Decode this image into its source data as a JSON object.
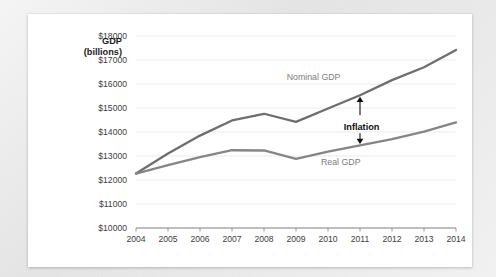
{
  "card": {
    "background_color": "#ffffff",
    "page_background_color": "#e9e9e9"
  },
  "axis_title": {
    "line1": "GDP",
    "line2": "(billions)"
  },
  "chart_data": {
    "type": "line",
    "title": "",
    "subtitle": "",
    "xlabel": "",
    "ylabel": "GDP (billions)",
    "grid": true,
    "legend_position": "inline-annotation",
    "x": [
      2004,
      2005,
      2006,
      2007,
      2008,
      2009,
      2010,
      2011,
      2012,
      2013,
      2014
    ],
    "categories": [
      "2004",
      "2005",
      "2006",
      "2007",
      "2008",
      "2009",
      "2010",
      "2011",
      "2012",
      "2013",
      "2014"
    ],
    "xlim": [
      2004,
      2014
    ],
    "ylim": [
      10000,
      18000
    ],
    "yticks": [
      10000,
      11000,
      12000,
      13000,
      14000,
      15000,
      16000,
      17000,
      18000
    ],
    "ytick_labels": [
      "$10000",
      "$11000",
      "$12000",
      "$13000",
      "$14000",
      "$15000",
      "$16000",
      "$17000",
      "$18000"
    ],
    "xtick_labels": [
      "2004",
      "2005",
      "2006",
      "2007",
      "2008",
      "2009",
      "2010",
      "2011",
      "2012",
      "2013",
      "2014"
    ],
    "series": [
      {
        "name": "Nominal GDP",
        "color": "#6e6e6e",
        "values": [
          12270,
          13100,
          13850,
          14480,
          14760,
          14420,
          14980,
          15530,
          16160,
          16700,
          17420
        ]
      },
      {
        "name": "Real GDP",
        "color": "#858585",
        "values": [
          12270,
          12620,
          12950,
          13240,
          13230,
          12880,
          13180,
          13440,
          13700,
          14020,
          14400
        ]
      }
    ],
    "annotations": [
      {
        "text": "Nominal GDP",
        "x": 2009.55,
        "y": 16150,
        "color": "#7d7d7d",
        "bold": false
      },
      {
        "text": "Real GDP",
        "x": 2010.4,
        "y": 12620,
        "color": "#7d7d7d",
        "bold": false
      },
      {
        "text": "Inflation",
        "x": 2011.05,
        "y": 14100,
        "color": "#111111",
        "bold": true
      }
    ],
    "inflation_arrow": {
      "x": 2011,
      "y_top": 15530,
      "y_bottom": 13440,
      "color": "#111111",
      "double_headed": true
    }
  }
}
